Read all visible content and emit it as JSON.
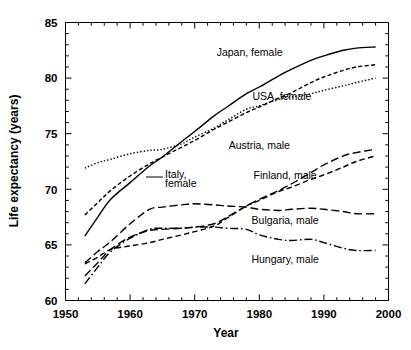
{
  "chart_data": {
    "type": "line",
    "title": "",
    "xlabel": "Year",
    "ylabel": "Life expectancy (years)",
    "xlim": [
      1950,
      2000
    ],
    "ylim": [
      60,
      85
    ],
    "xticks": [
      1950,
      1960,
      1970,
      1980,
      1990,
      2000
    ],
    "xtick_labels": [
      "1950",
      "1960",
      "1970",
      "1980",
      "1990",
      "2000"
    ],
    "yticks": [
      60,
      65,
      70,
      75,
      80,
      85
    ],
    "ytick_labels": [
      "60",
      "65",
      "70",
      "75",
      "80",
      "85"
    ],
    "x_minor_step": 2,
    "y_minor_step": 1,
    "grid": false,
    "legend_position": "inline-annotations",
    "series": [
      {
        "name": "Japan, female",
        "style": "solid",
        "label_x": 1978.5,
        "label_y": 82.0,
        "x": [
          1953,
          1955,
          1957,
          1960,
          1963,
          1965,
          1968,
          1970,
          1973,
          1975,
          1978,
          1980,
          1983,
          1985,
          1988,
          1990,
          1993,
          1995,
          1998
        ],
        "y": [
          65.8,
          67.5,
          69.1,
          70.6,
          72.1,
          72.9,
          74.3,
          75.2,
          76.6,
          77.4,
          78.6,
          79.2,
          80.2,
          80.8,
          81.6,
          82.0,
          82.5,
          82.7,
          82.8
        ]
      },
      {
        "name": "Italy, female",
        "style": "dashed",
        "label_x": 1963.5,
        "label_y": 72.3,
        "x": [
          1953,
          1955,
          1957,
          1960,
          1963,
          1965,
          1968,
          1970,
          1973,
          1975,
          1978,
          1980,
          1983,
          1985,
          1988,
          1990,
          1993,
          1995,
          1998
        ],
        "y": [
          67.7,
          68.8,
          69.9,
          71.2,
          72.3,
          72.9,
          73.8,
          74.4,
          75.4,
          76.0,
          76.9,
          77.4,
          78.2,
          78.7,
          79.6,
          80.1,
          80.7,
          81.0,
          81.2
        ]
      },
      {
        "name": "USA, female",
        "style": "dotted",
        "label_x": 1981.5,
        "label_y": 78.4,
        "x": [
          1953,
          1955,
          1957,
          1960,
          1963,
          1965,
          1968,
          1970,
          1973,
          1975,
          1978,
          1980,
          1983,
          1985,
          1988,
          1990,
          1993,
          1995,
          1998
        ],
        "y": [
          71.9,
          72.4,
          72.7,
          73.2,
          73.5,
          73.6,
          74.1,
          74.7,
          75.5,
          76.2,
          77.2,
          77.5,
          78.1,
          78.3,
          78.6,
          78.9,
          79.3,
          79.6,
          80.0
        ]
      },
      {
        "name": "Austria, male",
        "style": "dashed-long",
        "label_x": 1976.0,
        "label_y": 73.3,
        "x": [
          1953,
          1955,
          1957,
          1960,
          1963,
          1965,
          1968,
          1970,
          1973,
          1975,
          1978,
          1980,
          1983,
          1985,
          1988,
          1990,
          1993,
          1995,
          1998
        ],
        "y": [
          62.2,
          63.4,
          64.6,
          65.7,
          66.3,
          66.4,
          66.5,
          66.6,
          66.9,
          67.5,
          68.5,
          69.1,
          69.9,
          70.5,
          71.5,
          72.2,
          73.0,
          73.3,
          73.6
        ]
      },
      {
        "name": "Finland, male",
        "style": "dashed-med",
        "label_x": 1981.0,
        "label_y": 71.0,
        "x": [
          1953,
          1955,
          1957,
          1960,
          1963,
          1965,
          1968,
          1970,
          1973,
          1975,
          1978,
          1980,
          1983,
          1985,
          1988,
          1990,
          1993,
          1995,
          1998
        ],
        "y": [
          63.3,
          63.9,
          64.6,
          64.9,
          65.2,
          65.5,
          65.9,
          66.2,
          66.7,
          67.4,
          68.5,
          69.0,
          69.8,
          70.2,
          70.9,
          71.3,
          72.0,
          72.5,
          73.0
        ]
      },
      {
        "name": "Bulgaria, male",
        "style": "dashed-long",
        "label_x": 1981.0,
        "label_y": 66.8,
        "x": [
          1953,
          1955,
          1957,
          1960,
          1963,
          1965,
          1968,
          1970,
          1973,
          1975,
          1978,
          1980,
          1983,
          1985,
          1988,
          1990,
          1993,
          1995,
          1998
        ],
        "y": [
          63.4,
          64.4,
          65.3,
          66.9,
          68.2,
          68.4,
          68.6,
          68.7,
          68.6,
          68.5,
          68.4,
          68.2,
          68.1,
          68.2,
          68.3,
          68.2,
          68.0,
          67.8,
          67.8
        ]
      },
      {
        "name": "Hungary, male",
        "style": "dash-dot",
        "label_x": 1981.0,
        "label_y": 63.3,
        "x": [
          1953,
          1955,
          1957,
          1960,
          1963,
          1965,
          1968,
          1970,
          1973,
          1975,
          1978,
          1980,
          1983,
          1985,
          1988,
          1990,
          1993,
          1995,
          1998
        ],
        "y": [
          61.5,
          63.0,
          64.4,
          65.6,
          66.4,
          66.5,
          66.5,
          66.6,
          66.6,
          66.5,
          66.4,
          65.9,
          65.5,
          65.4,
          65.5,
          65.2,
          64.7,
          64.5,
          64.5
        ]
      }
    ]
  },
  "axes": {
    "y_axis_title": "Life expectancy (years)",
    "x_axis_title": "Year"
  },
  "annotations": {
    "japan": "Japan, female",
    "usa": "USA, female",
    "italy_line1": "Italy,",
    "italy_line2": "female",
    "austria": "Austria, male",
    "finland": "Finland, male",
    "bulgaria": "Bulgaria, male",
    "hungary": "Hungary, male"
  },
  "colors": {
    "line": "#000000",
    "background": "#ffffff",
    "text": "#000000"
  }
}
